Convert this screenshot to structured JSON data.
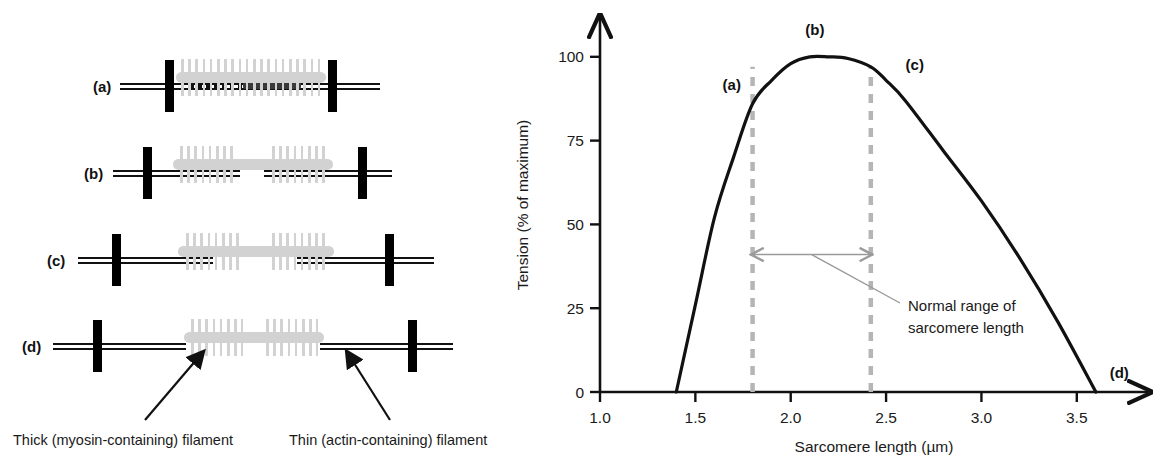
{
  "figure": {
    "left_panel": {
      "rows": [
        {
          "id": "a",
          "label": "(a)"
        },
        {
          "id": "b",
          "label": "(b)"
        },
        {
          "id": "c",
          "label": "(c)"
        },
        {
          "id": "d",
          "label": "(d)"
        }
      ],
      "captions": {
        "thick": "Thick (myosin-containing) filament",
        "thin": "Thin (actin-containing) filament"
      }
    },
    "chart_data": {
      "type": "line",
      "title": "",
      "xlabel": "Sarcomere length (µm)",
      "ylabel": "Tension (% of maximum)",
      "xlim": [
        1.0,
        3.8
      ],
      "ylim": [
        0,
        108
      ],
      "xticks": [
        1.0,
        1.5,
        2.0,
        2.5,
        3.0,
        3.5
      ],
      "xtick_labels": [
        "1.0",
        "1.5",
        "2.0",
        "2.5",
        "3.0",
        "3.5"
      ],
      "yticks": [
        0,
        25,
        50,
        75,
        100
      ],
      "ytick_labels": [
        "0",
        "25",
        "50",
        "75",
        "100"
      ],
      "grid": false,
      "legend": "none",
      "series": [
        {
          "name": "Tension vs sarcomere length",
          "x": [
            1.4,
            1.5,
            1.6,
            1.7,
            1.8,
            1.9,
            2.0,
            2.1,
            2.2,
            2.3,
            2.42,
            2.5,
            2.6,
            2.8,
            3.0,
            3.2,
            3.4,
            3.6
          ],
          "y": [
            0,
            26,
            52,
            70,
            86,
            93,
            98,
            100,
            100,
            99.5,
            97,
            93,
            87,
            72,
            57,
            40,
            21,
            0
          ]
        }
      ],
      "point_labels": [
        {
          "label": "(a)",
          "x": 1.8,
          "y": 86
        },
        {
          "label": "(b)",
          "x": 2.15,
          "y": 100
        },
        {
          "label": "(c)",
          "x": 2.55,
          "y": 93
        },
        {
          "label": "(d)",
          "x": 3.62,
          "y": 0
        }
      ],
      "reference_lines": [
        {
          "name": "normal-range-left",
          "x": 1.8
        },
        {
          "name": "normal-range-right",
          "x": 2.42
        }
      ],
      "annotations": [
        {
          "name": "normal-range",
          "text_line1": "Normal range of",
          "text_line2": "sarcomere length",
          "from_x": 1.8,
          "to_x": 2.42
        }
      ]
    }
  }
}
